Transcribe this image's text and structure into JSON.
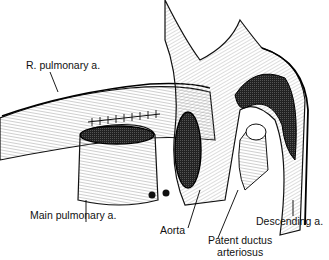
{
  "figure": {
    "labels": {
      "r_pulmonary": "R. pulmonary a.",
      "main_pulmonary": "Main pulmonary a.",
      "aorta": "Aorta",
      "pda_line1": "Patent ductus",
      "pda_line2": "arteriosus",
      "descending": "Descending a."
    }
  }
}
